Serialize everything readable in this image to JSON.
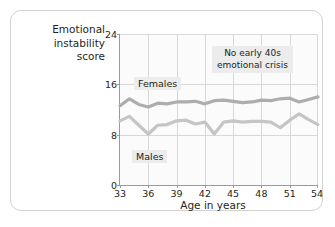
{
  "chart_data": {
    "type": "line",
    "title": "",
    "ylabel": "Emotional instability score",
    "ylabel_lines": [
      "Emotional",
      "instability",
      "score"
    ],
    "xlabel": "Age in years",
    "xlim": [
      33,
      54
    ],
    "ylim": [
      0,
      24
    ],
    "xticks": [
      33,
      36,
      39,
      42,
      45,
      48,
      51,
      54
    ],
    "yticks": [
      0,
      8,
      16,
      24
    ],
    "grid": true,
    "legend_position": "inline-labels",
    "x": [
      33,
      34,
      35,
      36,
      37,
      38,
      39,
      40,
      41,
      42,
      43,
      44,
      45,
      46,
      47,
      48,
      49,
      50,
      51,
      52,
      53,
      54
    ],
    "series": [
      {
        "name": "Females",
        "color": "#adadad",
        "values": [
          12.6,
          13.7,
          12.8,
          12.4,
          13.0,
          12.9,
          13.2,
          13.2,
          13.3,
          12.9,
          13.4,
          13.5,
          13.3,
          13.1,
          13.2,
          13.5,
          13.4,
          13.7,
          13.8,
          13.2,
          13.6,
          14.0
        ]
      },
      {
        "name": "Males",
        "color": "#c5c5c5",
        "values": [
          10.2,
          10.9,
          9.5,
          8.1,
          9.5,
          9.6,
          10.2,
          10.3,
          9.7,
          10.0,
          8.1,
          10.0,
          10.2,
          10.0,
          10.1,
          10.1,
          10.0,
          9.1,
          10.3,
          11.3,
          10.4,
          9.6
        ]
      }
    ],
    "annotations": [
      {
        "name": "no-early-40s-crisis",
        "lines": [
          "No early 40s",
          "emotional crisis"
        ],
        "text": "No early 40s emotional crisis"
      }
    ],
    "series_labels": {
      "females": "Females",
      "males": "Males"
    }
  }
}
